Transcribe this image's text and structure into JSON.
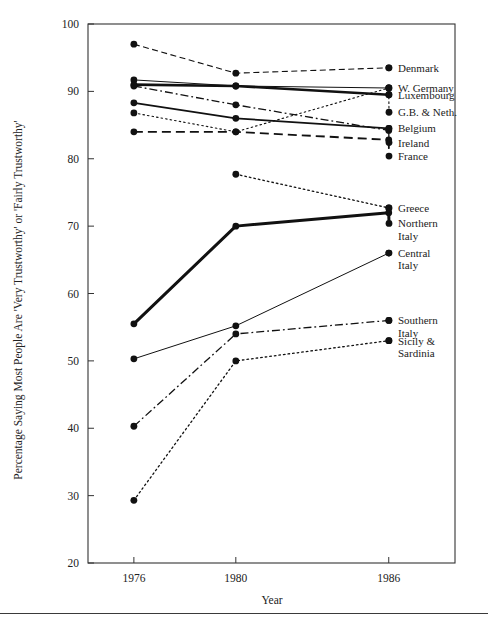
{
  "chart_data": {
    "type": "line",
    "title": "",
    "xlabel": "Year",
    "ylabel": "Percentage Saying Most People Are 'Very Trustworthy' or 'Fairly Trustworthy'",
    "x": [
      1976,
      1980,
      1986
    ],
    "xtick_labels": [
      "1976",
      "1980",
      "1986"
    ],
    "ytick_labels": [
      "20",
      "30",
      "40",
      "50",
      "60",
      "70",
      "80",
      "90",
      "100"
    ],
    "yticks": [
      20,
      30,
      40,
      50,
      60,
      70,
      80,
      90,
      100
    ],
    "ylim": [
      20,
      100
    ],
    "xlim": [
      1974.2,
      1988.6
    ],
    "grid": false,
    "legend_position": "right-inline-at-line-end",
    "series": [
      {
        "name": "Denmark",
        "label": "Denmark",
        "label_lines": [
          "Denmark"
        ],
        "x": [
          1976,
          1980,
          1986
        ],
        "values": [
          97.0,
          92.7,
          93.5
        ],
        "style": "dashed",
        "width": 1.1
      },
      {
        "name": "W. Germany",
        "label": "W. Germany",
        "label_lines": [
          "W. Germany"
        ],
        "x": [
          1976,
          1980,
          1986
        ],
        "values": [
          91.7,
          90.8,
          90.5
        ],
        "style": "solid",
        "width": 1.0
      },
      {
        "name": "Luxembourg",
        "label": "Luxembourg",
        "label_lines": [
          "Luxembourg"
        ],
        "x": [
          1976,
          1980,
          1986
        ],
        "values": [
          91.0,
          90.8,
          89.5
        ],
        "style": "solid",
        "width": 2.6
      },
      {
        "name": "G.B. & Neth.",
        "label": "G.B. & Neth.",
        "label_lines": [
          "G.B. & Neth."
        ],
        "x": [
          1976,
          1980,
          1986
        ],
        "values": [
          86.8,
          84.0,
          90.5
        ],
        "style": "dotted",
        "width": 1.1
      },
      {
        "name": "Belgium",
        "label": "Belgium",
        "label_lines": [
          "Belgium"
        ],
        "x": [
          1976,
          1980,
          1986
        ],
        "values": [
          88.3,
          86.0,
          84.5
        ],
        "style": "solid",
        "width": 1.7
      },
      {
        "name": "Ireland",
        "label": "Ireland",
        "label_lines": [
          "Ireland"
        ],
        "x": [
          1976,
          1980,
          1986
        ],
        "values": [
          90.8,
          88.0,
          84.2
        ],
        "style": "dashdot",
        "width": 1.3
      },
      {
        "name": "France",
        "label": "France",
        "label_lines": [
          "France"
        ],
        "x": [
          1976,
          1980,
          1986
        ],
        "values": [
          84.0,
          84.0,
          82.8
        ],
        "style": "longdash",
        "width": 1.8
      },
      {
        "name": "Greece",
        "label": "Greece",
        "label_lines": [
          "Greece"
        ],
        "x": [
          1980,
          1986
        ],
        "values": [
          77.7,
          72.7
        ],
        "style": "dotted",
        "width": 1.3
      },
      {
        "name": "Northern Italy",
        "label": "Northern Italy",
        "label_lines": [
          "Northern",
          "Italy"
        ],
        "x": [
          1976,
          1980,
          1986
        ],
        "values": [
          55.5,
          70.0,
          72.0
        ],
        "style": "solid",
        "width": 3.0
      },
      {
        "name": "Central Italy",
        "label": "Central Italy",
        "label_lines": [
          "Central",
          "Italy"
        ],
        "x": [
          1976,
          1980,
          1986
        ],
        "values": [
          50.3,
          55.2,
          66.0
        ],
        "style": "solid",
        "width": 1.0
      },
      {
        "name": "Southern Italy",
        "label": "Southern Italy",
        "label_lines": [
          "Southern",
          "Italy"
        ],
        "x": [
          1976,
          1980,
          1986
        ],
        "values": [
          40.3,
          54.0,
          56.0
        ],
        "style": "dashdot",
        "width": 1.3
      },
      {
        "name": "Sicily & Sardinia",
        "label": "Sicily & Sardinia",
        "label_lines": [
          "Sicily &",
          "Sardinia"
        ],
        "x": [
          1976,
          1980,
          1986
        ],
        "values": [
          29.3,
          50.0,
          53.0
        ],
        "style": "dotted",
        "width": 1.3
      }
    ]
  },
  "axes": {
    "y_title": "Percentage Saying Most People Are 'Very Trustworthy' or 'Fairly Trustworthy'",
    "x_title": "Year"
  },
  "colors": {
    "line": "#111111",
    "axis": "#333333",
    "text": "#222222",
    "background": "#ffffff"
  }
}
